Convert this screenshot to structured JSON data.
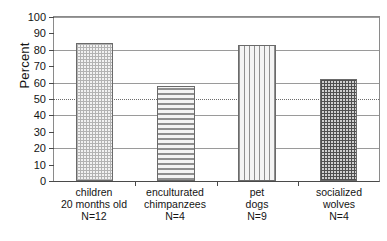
{
  "chart_data": {
    "type": "bar",
    "title": "",
    "xlabel": "",
    "ylabel": "Percent",
    "ylim": [
      0,
      100
    ],
    "ytick_step": 10,
    "gridline_step": 20,
    "grid": true,
    "legend": "none",
    "categories": [
      "children 20 months old N=12",
      "enculturated chimpanzees N=4",
      "pet dogs N=9",
      "socialized wolves N=4"
    ],
    "values": [
      84,
      58,
      83,
      62
    ],
    "annotations": [
      {
        "type": "reference-line",
        "axis": "y",
        "value": 50,
        "style": "dotted",
        "label": ""
      }
    ],
    "yticks": [
      "0",
      "10",
      "20",
      "30",
      "40",
      "50",
      "60",
      "70",
      "80",
      "90",
      "100"
    ],
    "gridlines": [
      0,
      20,
      40,
      60,
      80,
      100
    ],
    "bars": [
      {
        "label_lines": [
          "children",
          "20 months old",
          "N=12"
        ],
        "group": "children",
        "sample_size": "N=12",
        "value": 84,
        "fill": "crosshatch-light"
      },
      {
        "label_lines": [
          "enculturated",
          "chimpanzees",
          "N=4"
        ],
        "group": "enculturated chimpanzees",
        "sample_size": "N=4",
        "value": 58,
        "fill": "horizontal"
      },
      {
        "label_lines": [
          "pet",
          "dogs",
          "N=9"
        ],
        "group": "pet dogs",
        "sample_size": "N=9",
        "value": 83,
        "fill": "vertical"
      },
      {
        "label_lines": [
          "socialized",
          "wolves",
          "N=4"
        ],
        "group": "socialized wolves",
        "sample_size": "N=4",
        "value": 62,
        "fill": "crosshatch-dark"
      }
    ],
    "colors": {
      "axis": "#4a4a4a",
      "grid": "#9a9a9a",
      "reference_line": "#6b6b6b",
      "bar_light": "#f2f2f2",
      "bar_dark": "#cfcfcf",
      "text": "#141414",
      "background": "#ffffff"
    }
  }
}
